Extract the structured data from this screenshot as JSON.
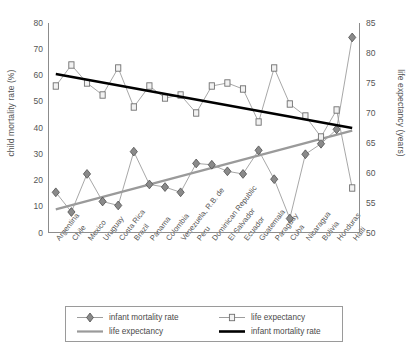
{
  "chart_data": {
    "type": "line",
    "title": "",
    "subtitle": "",
    "xlabel": "",
    "ylabel": "child mortality rate (%)",
    "y2label": "life expectancy (years)",
    "ylim": [
      0,
      80
    ],
    "y2lim": [
      50,
      85
    ],
    "yticks": [
      0,
      10,
      20,
      30,
      40,
      50,
      60,
      70,
      80
    ],
    "y2ticks": [
      50,
      55,
      60,
      65,
      70,
      75,
      80,
      85
    ],
    "grid": false,
    "legend_position": "bottom",
    "categories": [
      "Argentina",
      "Chile",
      "Mexico",
      "Uruguay",
      "Costa Rica",
      "Brazil",
      "Panama",
      "Colombia",
      "Venezuela, R.B. de",
      "Peru",
      "Dominican Republic",
      "El Salvador",
      "Ecuador",
      "Guatemala",
      "Paraguay",
      "Cuba",
      "Nicaragua",
      "Bolivia",
      "Honduras",
      "Haiti"
    ],
    "series": [
      {
        "name": "infant mortality rate",
        "kind": "markers-line",
        "axis": "left",
        "marker": "diamond",
        "color": "#7d7d7d",
        "values": [
          15.5,
          8.0,
          22.5,
          12.0,
          10.5,
          31.0,
          18.5,
          17.5,
          15.5,
          26.5,
          26.0,
          23.5,
          22.5,
          31.5,
          20.5,
          5.5,
          30.0,
          34.0,
          39.5,
          74.5
        ]
      },
      {
        "name": "life expectancy",
        "kind": "markers-line",
        "axis": "right",
        "marker": "square",
        "color": "#8a8a8a",
        "values": [
          74.5,
          78.0,
          75.0,
          73.0,
          77.5,
          71.0,
          74.5,
          72.5,
          73.0,
          70.0,
          74.5,
          75.0,
          74.0,
          68.5,
          77.5,
          71.5,
          69.5,
          66.0,
          70.5,
          57.5
        ]
      },
      {
        "name": "life expectancy",
        "kind": "trendline",
        "axis": "left",
        "color": "#9a9a9a",
        "endpoints": [
          9.0,
          39.0
        ]
      },
      {
        "name": "infant mortality rate",
        "kind": "trendline",
        "axis": "right",
        "color": "#000000",
        "endpoints": [
          76.5,
          67.5
        ]
      }
    ]
  },
  "legend": {
    "items": [
      {
        "label": "infant mortality rate",
        "symbol": "diamond-line",
        "name": "legend-infant-mortality-markers"
      },
      {
        "label": "life expectancy",
        "symbol": "square-line",
        "name": "legend-life-expectancy-markers"
      },
      {
        "label": "life expectancy",
        "symbol": "gray-line",
        "name": "legend-life-expectancy-trend"
      },
      {
        "label": "infant mortality rate",
        "symbol": "black-line",
        "name": "legend-infant-mortality-trend"
      }
    ]
  },
  "colors": {
    "axis": "#555555",
    "frame": "#8c8c8c",
    "infant_marker": "#7d7d7d",
    "life_marker": "#8a8a8a",
    "trend_gray": "#9a9a9a",
    "trend_black": "#000000",
    "background": "#ffffff"
  }
}
